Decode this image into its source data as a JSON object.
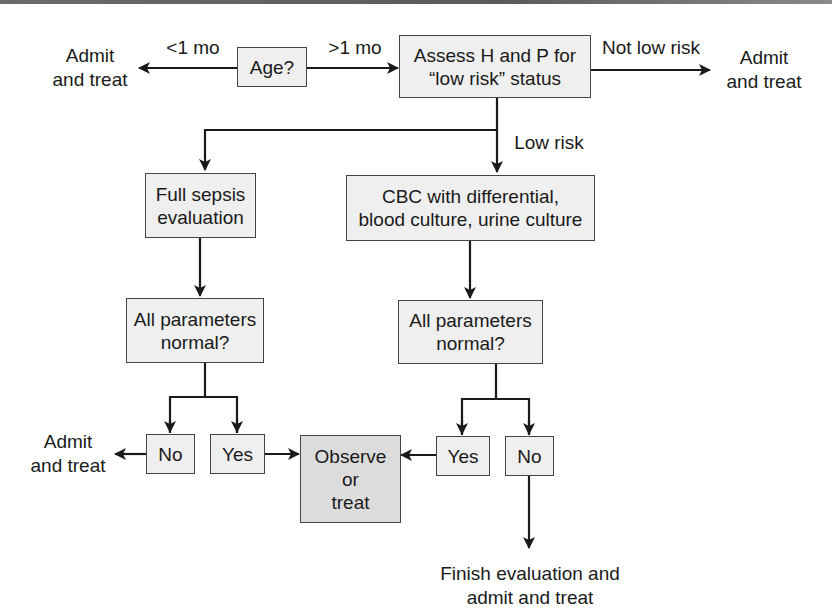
{
  "diagram": {
    "type": "flowchart",
    "nodes": {
      "age": "Age?",
      "assess": "Assess H and P for\n“low risk” status",
      "full_sepsis": "Full sepsis\nevaluation",
      "cbc": "CBC with differential,\nblood culture, urine culture",
      "params_left": "All parameters\nnormal?",
      "params_right": "All parameters\nnormal?",
      "no_left": "No",
      "yes_left": "Yes",
      "observe": "Observe\nor\ntreat",
      "yes_right": "Yes",
      "no_right": "No"
    },
    "terminals": {
      "admit_under_1mo": "Admit\nand treat",
      "admit_not_low_risk": "Admit\nand treat",
      "admit_left_no": "Admit\nand treat",
      "finish_eval": "Finish evaluation and\nadmit and treat"
    },
    "edge_labels": {
      "lt_1mo": "<1 mo",
      "gt_1mo": ">1 mo",
      "not_low_risk": "Not low risk",
      "low_risk": "Low risk"
    },
    "edges": [
      {
        "from": "age",
        "to": "admit_under_1mo",
        "label": "<1 mo"
      },
      {
        "from": "age",
        "to": "assess",
        "label": ">1 mo"
      },
      {
        "from": "assess",
        "to": "admit_not_low_risk",
        "label": "Not low risk"
      },
      {
        "from": "assess",
        "to": "full_sepsis",
        "label": ""
      },
      {
        "from": "assess",
        "to": "cbc",
        "label": "Low risk"
      },
      {
        "from": "full_sepsis",
        "to": "params_left",
        "label": ""
      },
      {
        "from": "cbc",
        "to": "params_right",
        "label": ""
      },
      {
        "from": "params_left",
        "to": "no_left",
        "label": ""
      },
      {
        "from": "params_left",
        "to": "yes_left",
        "label": ""
      },
      {
        "from": "no_left",
        "to": "admit_left_no",
        "label": ""
      },
      {
        "from": "yes_left",
        "to": "observe",
        "label": ""
      },
      {
        "from": "params_right",
        "to": "yes_right",
        "label": ""
      },
      {
        "from": "params_right",
        "to": "no_right",
        "label": ""
      },
      {
        "from": "yes_right",
        "to": "observe",
        "label": ""
      },
      {
        "from": "no_right",
        "to": "finish_eval",
        "label": ""
      }
    ],
    "colors": {
      "box_fill": "#efefef",
      "box_fill_highlight": "#dcdcdc",
      "line": "#1a1a1a",
      "top_band": "#666666"
    }
  }
}
